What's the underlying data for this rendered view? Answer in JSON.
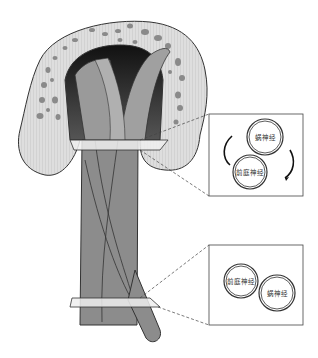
{
  "figure": {
    "colors": {
      "bone": "#dcdcdc",
      "bone_spots": "#8a8a8a",
      "nerve_dark": "#6e6e6e",
      "nerve_mid": "#8c8c8c",
      "outline": "#333333"
    }
  },
  "insets": [
    {
      "id": "upper",
      "labels": {
        "top_circle": "蜗神经",
        "bottom_circle": "前庭神经"
      },
      "rotation_arrows": true
    },
    {
      "id": "lower",
      "labels": {
        "left_circle": "前庭神经",
        "right_circle": "蜗神经"
      },
      "rotation_arrows": false
    }
  ]
}
